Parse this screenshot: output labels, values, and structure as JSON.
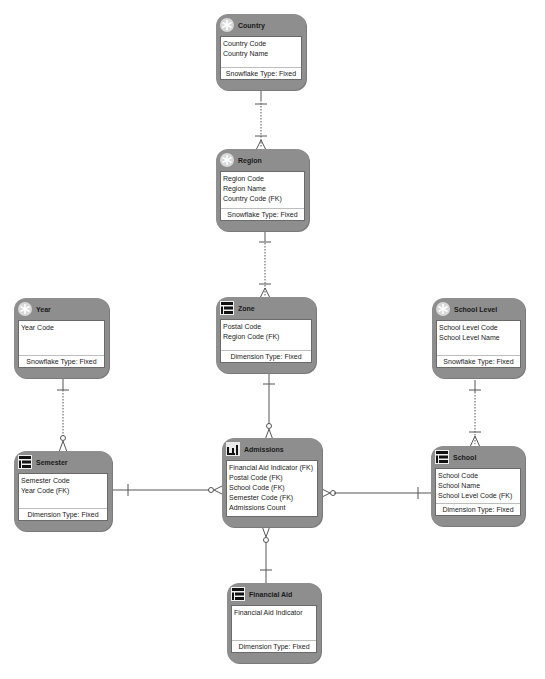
{
  "entities": {
    "country": {
      "title": "Country",
      "icon": "snowflake-icon",
      "attributes": [
        "Country Code",
        "Country Name"
      ],
      "footer": "Snowflake Type: Fixed"
    },
    "region": {
      "title": "Region",
      "icon": "snowflake-icon",
      "attributes": [
        "Region Code",
        "Region Name",
        "Country Code (FK)"
      ],
      "footer": "Snowflake Type: Fixed"
    },
    "zone": {
      "title": "Zone",
      "icon": "dimension-icon",
      "attributes": [
        "Postal Code",
        "Region Code (FK)"
      ],
      "footer": "Dimension Type: Fixed"
    },
    "year": {
      "title": "Year",
      "icon": "snowflake-icon",
      "attributes": [
        "Year Code"
      ],
      "footer": "Snowflake Type: Fixed"
    },
    "school_level": {
      "title": "School Level",
      "icon": "snowflake-icon",
      "attributes": [
        "School Level Code",
        "School Level Name"
      ],
      "footer": "Snowflake Type: Fixed"
    },
    "semester": {
      "title": "Semester",
      "icon": "dimension-icon",
      "attributes": [
        "Semester Code",
        "Year Code (FK)"
      ],
      "footer": "Dimension Type: Fixed"
    },
    "admissions": {
      "title": "Admissions",
      "icon": "fact-table-icon",
      "attributes": [
        "Financial Aid Indicator (FK)",
        "Postal Code (FK)",
        "School Code (FK)",
        "Semester Code (FK)",
        "Admissions Count"
      ],
      "footer": ""
    },
    "school": {
      "title": "School",
      "icon": "dimension-icon",
      "attributes": [
        "School Code",
        "School Name",
        "School Level Code (FK)"
      ],
      "footer": "Dimension Type: Fixed"
    },
    "financial_aid": {
      "title": "Financial Aid",
      "icon": "dimension-icon",
      "attributes": [
        "Financial Aid Indicator"
      ],
      "footer": "Dimension Type: Fixed"
    }
  },
  "relationships": [
    {
      "from": "Country",
      "to": "Region",
      "style": "dotted",
      "cardinality": "one-to-many"
    },
    {
      "from": "Region",
      "to": "Zone",
      "style": "dotted",
      "cardinality": "one-to-many"
    },
    {
      "from": "Year",
      "to": "Semester",
      "style": "dotted",
      "cardinality": "one-to-zero-or-many"
    },
    {
      "from": "School Level",
      "to": "School",
      "style": "dotted",
      "cardinality": "one-to-many"
    },
    {
      "from": "Zone",
      "to": "Admissions",
      "style": "solid",
      "cardinality": "one-to-zero-or-many"
    },
    {
      "from": "Semester",
      "to": "Admissions",
      "style": "solid",
      "cardinality": "one-to-zero-or-many"
    },
    {
      "from": "School",
      "to": "Admissions",
      "style": "solid",
      "cardinality": "one-to-zero-or-many"
    },
    {
      "from": "Financial Aid",
      "to": "Admissions",
      "style": "solid",
      "cardinality": "one-to-zero-or-many"
    }
  ]
}
